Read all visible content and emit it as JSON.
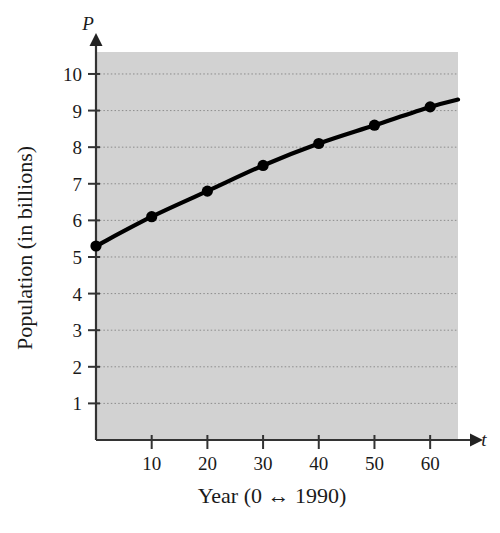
{
  "figure": {
    "background_color": "#ffffff",
    "plot_area_color": "#d2d2d2",
    "gridline_color": "#808080",
    "curve_color": "#000000",
    "axis_color": "#333333"
  },
  "axes": {
    "y_variable": "P",
    "x_variable": "t",
    "y_title": "Population (in billions)",
    "x_title": "Year (0 ↔ 1990)"
  },
  "chart_data": {
    "type": "line",
    "title": "",
    "xlabel": "Year (0 ↔ 1990)",
    "ylabel": "Population (in billions)",
    "x_variable": "t",
    "y_variable": "P",
    "x": [
      0,
      10,
      20,
      30,
      40,
      50,
      60
    ],
    "values": [
      5.3,
      6.1,
      6.8,
      7.5,
      8.1,
      8.6,
      9.1
    ],
    "series": [
      {
        "name": "Population",
        "x": [
          0,
          10,
          20,
          30,
          40,
          50,
          60
        ],
        "values": [
          5.3,
          6.1,
          6.8,
          7.5,
          8.1,
          8.6,
          9.1
        ]
      }
    ],
    "markers": true,
    "curve_extends_to_x": 65,
    "curve_end_value": 9.3,
    "xlim": [
      0,
      65
    ],
    "ylim": [
      0,
      10.6
    ],
    "xticks": [
      10,
      20,
      30,
      40,
      50,
      60
    ],
    "xtick_labels": [
      "10",
      "20",
      "30",
      "40",
      "50",
      "60"
    ],
    "yticks": [
      1,
      2,
      3,
      4,
      5,
      6,
      7,
      8,
      9,
      10
    ],
    "ytick_labels": [
      "1",
      "2",
      "3",
      "4",
      "5",
      "6",
      "7",
      "8",
      "9",
      "10"
    ],
    "grid": true,
    "grid_axis": "y",
    "grid_style": "dotted",
    "legend": false,
    "legend_position": "none"
  }
}
